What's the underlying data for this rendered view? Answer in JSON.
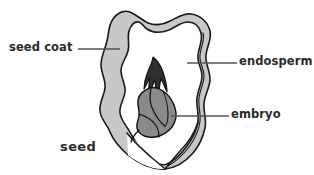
{
  "figure": {
    "title": "seed",
    "caption": "seed",
    "type": "botanical-cross-section",
    "background_color": "#ffffff",
    "width": 314,
    "height": 175,
    "outline_color": "#1a1a1a",
    "leader_line_color": "#555555",
    "text_color": "#2b2b2b"
  },
  "labels": {
    "seed_coat": "seed coat",
    "endosperm": "endosperm",
    "embryo": "embryo",
    "seed": "seed"
  },
  "parts": [
    {
      "name": "seed-coat",
      "label": "seed coat",
      "fill_color": "#c8c8c8",
      "stroke_color": "#1a1a1a",
      "leader": {
        "x1": 78,
        "y1": 49,
        "x2": 120,
        "y2": 49
      }
    },
    {
      "name": "endosperm",
      "label": "endosperm",
      "fill_color": "#ffffff",
      "stroke_color": "#1a1a1a",
      "leader": {
        "x1": 187,
        "y1": 63,
        "x2": 237,
        "y2": 63
      }
    },
    {
      "name": "embryo",
      "label": "embryo",
      "fill_color": "#8a8a8a",
      "stroke_color": "#111111",
      "leader": {
        "x1": 171,
        "y1": 116,
        "x2": 229,
        "y2": 116
      }
    }
  ]
}
